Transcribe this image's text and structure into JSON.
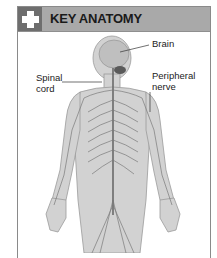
{
  "panel": {
    "title": "KEY ANATOMY",
    "icon": "medical-cross-icon",
    "header_color": "#a9a9a9",
    "icon_box_color": "#6e6e6e"
  },
  "labels": {
    "brain": "Brain",
    "spinal_cord_line1": "Spinal",
    "spinal_cord_line2": "cord",
    "peripheral_line1": "Peripheral",
    "peripheral_line2": "nerve"
  },
  "illustration": {
    "subject": "human-nervous-system",
    "body_color": "#cfcfcf",
    "nerve_color": "#7a7a7a",
    "highlight_color": "#5a5a5a"
  }
}
